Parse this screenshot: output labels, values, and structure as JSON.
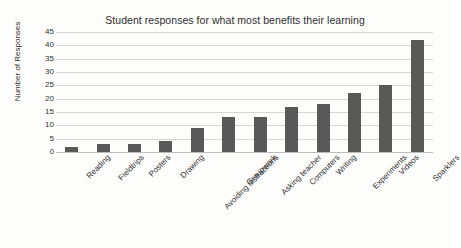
{
  "chart_data": {
    "type": "bar",
    "title": "Student responses for what most benefits their learning",
    "xlabel": "",
    "ylabel": "Number of Responses",
    "categories": [
      "Reading",
      "Fieldtrips",
      "Posters",
      "Drawing",
      "Avoiding distractions",
      "Groupwork",
      "Asking teacher",
      "Computers",
      "Writing",
      "Experiments",
      "Videos",
      "Sparklers"
    ],
    "values": [
      2,
      3,
      3,
      4,
      9,
      13,
      13,
      17,
      18,
      22,
      25,
      42
    ],
    "ylim": [
      0,
      45
    ],
    "yticks": [
      0,
      5,
      10,
      15,
      20,
      25,
      30,
      35,
      40,
      45
    ],
    "ytick_labels": [
      "0",
      "5",
      "10",
      "15",
      "20",
      "25",
      "30",
      "35",
      "40",
      "45"
    ],
    "grid": true,
    "legend": false,
    "series_color": "#595959",
    "gridline_color": "#d6d6d6",
    "background_color": "#fdfdfc"
  }
}
